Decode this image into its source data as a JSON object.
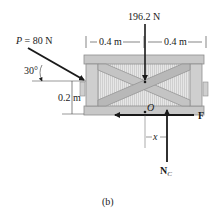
{
  "diagram": {
    "caption": "(b)",
    "applied_force": {
      "symbol": "P",
      "equals": " = 80 N",
      "angle_label": "30°"
    },
    "weight_label": "196.2 N",
    "dimensions": {
      "left_span": "0.4 m",
      "right_span": "0.4 m",
      "height": "0.2 m"
    },
    "point_label": "O",
    "friction_label": "F",
    "normal_label": "N",
    "normal_subscript": "C",
    "offset_label": "x",
    "colors": {
      "crate_light": "#d8d8d8",
      "crate_mid": "#bdbdbd",
      "crate_dark": "#9a9a9a",
      "arrow": "#1a1a1a"
    }
  }
}
